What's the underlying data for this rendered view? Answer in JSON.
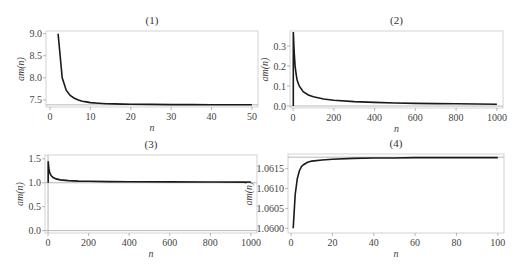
{
  "chart_data": [
    {
      "type": "line",
      "title": "(1)",
      "xlabel": "n",
      "ylabel": "am(n)",
      "xlim": [
        -1,
        51.5
      ],
      "ylim": [
        7.34,
        9.06
      ],
      "xticks": [
        0,
        10,
        20,
        30,
        40,
        50
      ],
      "yticks": [
        7.5,
        8.0,
        8.5,
        9.0
      ],
      "ytick_labels": [
        "7.5",
        "8.0",
        "8.5",
        "9.0"
      ],
      "asymptote_y": 7.389,
      "series": [
        {
          "name": "am(n)",
          "x": [
            2,
            3,
            4,
            5,
            6,
            7,
            8,
            9,
            10,
            12,
            14,
            16,
            18,
            20,
            25,
            30,
            35,
            40,
            45,
            50
          ],
          "y": [
            9.0,
            8.0,
            7.72,
            7.6,
            7.54,
            7.5,
            7.47,
            7.455,
            7.44,
            7.425,
            7.415,
            7.41,
            7.405,
            7.4,
            7.398,
            7.395,
            7.394,
            7.393,
            7.392,
            7.391
          ]
        }
      ]
    },
    {
      "type": "line",
      "title": "(2)",
      "xlabel": "n",
      "ylabel": "am(n)",
      "xlim": [
        -15,
        1030
      ],
      "ylim": [
        -0.01,
        0.375
      ],
      "xticks": [
        0,
        200,
        400,
        600,
        800,
        1000
      ],
      "yticks": [
        0.0,
        0.1,
        0.2,
        0.3
      ],
      "ytick_labels": [
        "0.0",
        "0.1",
        "0.2",
        "0.3"
      ],
      "asymptote_y": 0.0,
      "series": [
        {
          "name": "am(n)",
          "x": [
            1,
            1,
            2,
            4,
            6,
            10,
            15,
            20,
            30,
            50,
            75,
            100,
            150,
            200,
            300,
            400,
            500,
            600,
            700,
            800,
            900,
            1000
          ],
          "y": [
            0.0,
            0.37,
            0.35,
            0.3,
            0.26,
            0.2,
            0.16,
            0.13,
            0.1,
            0.072,
            0.055,
            0.046,
            0.035,
            0.029,
            0.022,
            0.018,
            0.015,
            0.013,
            0.012,
            0.011,
            0.01,
            0.009
          ]
        }
      ]
    },
    {
      "type": "line",
      "title": "(3)",
      "xlabel": "n",
      "ylabel": "am(n)",
      "xlim": [
        -15,
        1030
      ],
      "ylim": [
        -0.05,
        1.58
      ],
      "xticks": [
        0,
        200,
        400,
        600,
        800,
        1000
      ],
      "yticks": [
        0.0,
        0.5,
        1.0,
        1.5
      ],
      "ytick_labels": [
        "0.0",
        "0.5",
        "1.0",
        "1.5"
      ],
      "asymptote_y": 1.0,
      "asymptote_y2": 0.0,
      "series": [
        {
          "name": "am(n)",
          "x": [
            1,
            1,
            2,
            4,
            8,
            15,
            25,
            40,
            60,
            100,
            150,
            200,
            300,
            400,
            600,
            800,
            1000
          ],
          "y": [
            1.0,
            1.45,
            1.4,
            1.3,
            1.21,
            1.15,
            1.11,
            1.08,
            1.06,
            1.045,
            1.035,
            1.03,
            1.025,
            1.02,
            1.017,
            1.015,
            1.014
          ]
        }
      ]
    },
    {
      "type": "line",
      "title": "(4)",
      "xlabel": "n",
      "ylabel": "am(n)",
      "xlim": [
        -1.5,
        103
      ],
      "ylim": [
        1.05988,
        1.06187
      ],
      "xticks": [
        0,
        20,
        40,
        60,
        80,
        100
      ],
      "yticks": [
        1.06,
        1.0605,
        1.061,
        1.0615
      ],
      "ytick_labels": [
        "1.0600",
        "1.0605",
        "1.0610",
        "1.0615"
      ],
      "asymptote_y": 1.06179,
      "series": [
        {
          "name": "am(n)",
          "x": [
            1,
            2,
            3,
            4,
            5,
            6,
            8,
            10,
            15,
            20,
            30,
            40,
            50,
            60,
            80,
            100
          ],
          "y": [
            1.06,
            1.06085,
            1.06125,
            1.06145,
            1.06155,
            1.0616,
            1.06166,
            1.06169,
            1.06172,
            1.06174,
            1.06176,
            1.06177,
            1.06177,
            1.06178,
            1.06178,
            1.06178
          ]
        }
      ]
    }
  ]
}
